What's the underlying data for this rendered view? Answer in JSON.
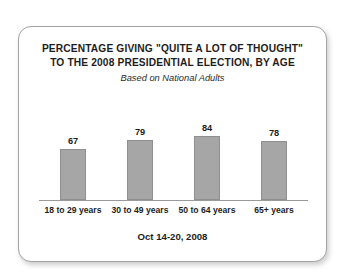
{
  "card": {
    "border_color": "#a3a3a3",
    "background": "#ffffff"
  },
  "chart_data": {
    "type": "bar",
    "title_lines": [
      "PERCENTAGE GIVING \"QUITE A LOT OF THOUGHT\"",
      "TO THE 2008 PRESIDENTIAL ELECTION, BY AGE"
    ],
    "subtitle": "Based on National Adults",
    "footer": "Oct 14-20, 2008",
    "categories": [
      "18 to 29 years",
      "30 to 49 years",
      "50 to 64 years",
      "65+ years"
    ],
    "values": [
      67,
      79,
      84,
      78
    ],
    "value_labels": [
      "67",
      "79",
      "84",
      "78"
    ],
    "xlabel": "",
    "ylabel": "",
    "ylim": [
      0,
      100
    ],
    "grid": false,
    "legend": false,
    "bar_color": "#a6a6a6",
    "bar_border_color": "#8f8f8f",
    "axis_color": "#9a9a9a"
  }
}
